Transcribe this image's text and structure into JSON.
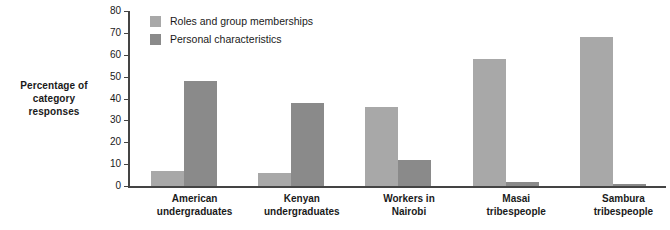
{
  "chart_data": {
    "type": "bar",
    "title": "",
    "xlabel": "",
    "ylabel": "Percentage of category responses",
    "ylim": [
      0,
      80
    ],
    "yticks": [
      0,
      10,
      20,
      30,
      40,
      50,
      60,
      70,
      80
    ],
    "grid": false,
    "legend_position": "top-left-inside",
    "categories": [
      "American undergraduates",
      "Kenyan undergraduates",
      "Workers in Nairobi",
      "Masai tribespeople",
      "Sambura tribespeople"
    ],
    "category_lines": [
      [
        "American",
        "undergraduates"
      ],
      [
        "Kenyan",
        "undergraduates"
      ],
      [
        "Workers in",
        "Nairobi"
      ],
      [
        "Masai",
        "tribespeople"
      ],
      [
        "Sambura",
        "tribespeople"
      ]
    ],
    "series": [
      {
        "name": "Roles and group memberships",
        "color": "#a8a8a8",
        "values": [
          7,
          6,
          36,
          58,
          68
        ]
      },
      {
        "name": "Personal characteristics",
        "color": "#8a8a8a",
        "values": [
          48,
          38,
          12,
          2,
          1
        ]
      }
    ]
  },
  "axis": {
    "y_title_line1": "Percentage of",
    "y_title_line2": "category responses"
  }
}
